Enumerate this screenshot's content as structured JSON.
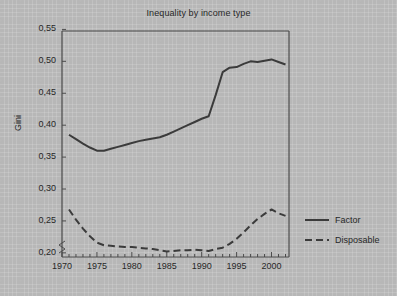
{
  "chart_data": {
    "type": "line",
    "title": "Inequality by income type",
    "xlabel": "",
    "ylabel": "Gini",
    "xlim": [
      1970,
      2002.5
    ],
    "ylim": [
      0.19,
      0.55
    ],
    "grid": false,
    "legend_position": "right",
    "y_axis_break": true,
    "decimal_separator": ",",
    "xticks": [
      1970,
      1975,
      1980,
      1985,
      1990,
      1995,
      2000
    ],
    "xtick_labels": [
      "1970",
      "1975",
      "1980",
      "1985",
      "1990",
      "1995",
      "2000"
    ],
    "yticks": [
      0.2,
      0.25,
      0.3,
      0.35,
      0.4,
      0.45,
      0.5,
      0.55
    ],
    "ytick_labels": [
      "0,20",
      "0,25",
      "0,30",
      "0,35",
      "0,40",
      "0,45",
      "0,50",
      "0,55"
    ],
    "x": [
      1971,
      1972,
      1973,
      1974,
      1975,
      1976,
      1977,
      1978,
      1979,
      1980,
      1981,
      1982,
      1983,
      1984,
      1985,
      1986,
      1987,
      1988,
      1989,
      1990,
      1991,
      1992,
      1993,
      1994,
      1995,
      1996,
      1997,
      1998,
      1999,
      2000,
      2001,
      2002
    ],
    "series": [
      {
        "name": "Factor",
        "style": "solid",
        "color": "#3b3b3b",
        "values": [
          0.385,
          0.378,
          0.371,
          0.365,
          0.36,
          0.36,
          0.363,
          0.366,
          0.369,
          0.372,
          0.375,
          0.377,
          0.379,
          0.381,
          0.385,
          0.39,
          0.395,
          0.4,
          0.405,
          0.41,
          0.414,
          0.447,
          0.483,
          0.49,
          0.491,
          0.496,
          0.5,
          0.499,
          0.501,
          0.503,
          0.499,
          0.495
        ]
      },
      {
        "name": "Disposable",
        "style": "dashed",
        "color": "#3b3b3b",
        "values": [
          0.268,
          0.252,
          0.238,
          0.226,
          0.216,
          0.212,
          0.211,
          0.21,
          0.209,
          0.209,
          0.208,
          0.207,
          0.206,
          0.204,
          0.202,
          0.203,
          0.204,
          0.204,
          0.205,
          0.204,
          0.203,
          0.206,
          0.208,
          0.214,
          0.222,
          0.232,
          0.243,
          0.253,
          0.261,
          0.268,
          0.262,
          0.258
        ]
      }
    ]
  },
  "legend": {
    "items": [
      {
        "label": "Factor"
      },
      {
        "label": "Disposable"
      }
    ]
  }
}
